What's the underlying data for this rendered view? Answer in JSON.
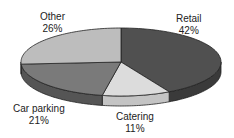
{
  "chart_data": {
    "type": "pie",
    "style": "3d",
    "title": "",
    "categories": [
      "Retail",
      "Catering",
      "Car parking",
      "Other"
    ],
    "values": [
      42,
      11,
      21,
      26
    ],
    "unit": "%",
    "colors": [
      "#505050",
      "#dcdcdc",
      "#7a7a7a",
      "#bdbdbd"
    ],
    "side_colors": [
      "#3a3a3a",
      "#c4c4c4",
      "#555555",
      "#8e8e8e"
    ],
    "start_angle_deg": 0,
    "direction": "clockwise",
    "legend": "none",
    "labels": [
      {
        "name": "Retail",
        "value": "42%"
      },
      {
        "name": "Catering",
        "value": "11%"
      },
      {
        "name": "Car parking",
        "value": "21%"
      },
      {
        "name": "Other",
        "value": "26%"
      }
    ]
  }
}
